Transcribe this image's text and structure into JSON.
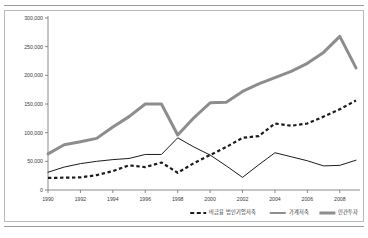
{
  "figure": {
    "frame_border_color": "#b9b9b9",
    "rule_color": "#9a9a9a"
  },
  "chart_data": {
    "type": "line",
    "title": "",
    "subtitle": "",
    "xlabel": "",
    "ylabel": "",
    "grid": false,
    "legend_position": "bottom",
    "x": [
      1990,
      1991,
      1992,
      1993,
      1994,
      1995,
      1996,
      1997,
      1998,
      1999,
      2000,
      2001,
      2002,
      2003,
      2004,
      2005,
      2006,
      2007,
      2008,
      2009
    ],
    "xlim": [
      1990,
      2009
    ],
    "ylim": [
      0,
      300000
    ],
    "ytick_values": [
      0,
      50000,
      100000,
      150000,
      200000,
      250000,
      300000
    ],
    "ytick_labels": [
      "0",
      "50,000",
      "100,000",
      "150,000",
      "200,000",
      "250,000",
      "300,000"
    ],
    "xtick_values": [
      1990,
      1992,
      1994,
      1996,
      1998,
      2000,
      2002,
      2004,
      2006,
      2008
    ],
    "xtick_labels": [
      "1990",
      "1992",
      "1994",
      "1996",
      "1998",
      "2000",
      "2002",
      "2004",
      "2006",
      "2008"
    ],
    "series": [
      {
        "name": "비금융 법인기업저축",
        "style": "dashed",
        "color": "#1c1c1c",
        "width": 2.2,
        "values": [
          21000,
          21500,
          22000,
          26000,
          33000,
          43000,
          40000,
          48000,
          30000,
          47000,
          61000,
          75000,
          91000,
          94000,
          116000,
          112000,
          116000,
          128000,
          141000,
          156000
        ]
      },
      {
        "name": "가계저축",
        "style": "solid-thin",
        "color": "#1c1c1c",
        "width": 1.0,
        "values": [
          31000,
          40000,
          46000,
          50000,
          53000,
          55000,
          62000,
          62000,
          91000,
          75000,
          61000,
          42000,
          22000,
          44000,
          65000,
          58000,
          51000,
          42000,
          43000,
          52000
        ]
      },
      {
        "name": "민간투자",
        "style": "solid-thick",
        "color": "#8d8d8d",
        "width": 3.0,
        "values": [
          63000,
          79000,
          84000,
          90000,
          110000,
          128000,
          150000,
          150000,
          96000,
          126000,
          152000,
          153000,
          172000,
          185000,
          196000,
          207000,
          221000,
          240000,
          268000,
          213000
        ]
      }
    ]
  },
  "legend": {
    "items": [
      {
        "label": "비금융 법인기업저축",
        "style": "dashed",
        "color": "#1c1c1c"
      },
      {
        "label": "가계저축",
        "style": "solid-thin",
        "color": "#1c1c1c"
      },
      {
        "label": "민간투자",
        "style": "solid-thick",
        "color": "#8d8d8d"
      }
    ]
  }
}
